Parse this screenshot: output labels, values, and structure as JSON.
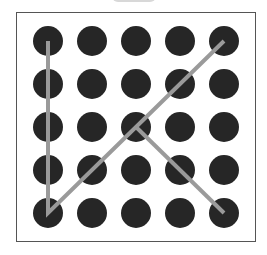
{
  "pattern_lock": {
    "rows": 5,
    "cols": 5,
    "dot_color": "#262626",
    "line_color": "#9a9a9a",
    "col_x": [
      48,
      92,
      136,
      180,
      224
    ],
    "row_y": [
      41,
      84,
      127,
      170,
      213
    ],
    "dot_radius": 15,
    "path": [
      [
        0,
        0
      ],
      [
        0,
        4
      ],
      [
        4,
        0
      ]
    ],
    "path2": [
      [
        2,
        2
      ],
      [
        4,
        4
      ]
    ]
  }
}
